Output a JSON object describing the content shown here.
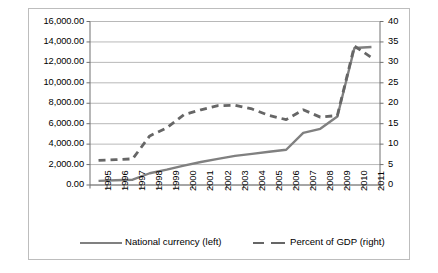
{
  "chart_data": {
    "type": "line",
    "title": "",
    "xlabel": "",
    "ylabel": "",
    "grid": true,
    "legend_position": "bottom",
    "x": [
      "1995",
      "1996",
      "1997",
      "1998",
      "1999",
      "2000",
      "2001",
      "2002",
      "2003",
      "2004",
      "2005",
      "2006",
      "2007",
      "2008",
      "2009",
      "2010",
      "2011"
    ],
    "categories": [
      "1995",
      "1996",
      "1997",
      "1998",
      "1999",
      "2000",
      "2001",
      "2002",
      "2003",
      "2004",
      "2005",
      "2006",
      "2007",
      "2008",
      "2009",
      "2010",
      "2011"
    ],
    "y_left": {
      "label": "",
      "ticks": [
        "0.00",
        "2,000.00",
        "4,000.00",
        "6,000.00",
        "8,000.00",
        "10,000.00",
        "12,000.00",
        "14,000.00",
        "16,000.00"
      ],
      "tick_values": [
        0,
        2000,
        4000,
        6000,
        8000,
        10000,
        12000,
        14000,
        16000
      ],
      "ylim": [
        0,
        16000
      ]
    },
    "y_right": {
      "label": "",
      "ticks": [
        "0",
        "5",
        "10",
        "15",
        "20",
        "25",
        "30",
        "35",
        "40"
      ],
      "tick_values": [
        0,
        5,
        10,
        15,
        20,
        25,
        30,
        35,
        40
      ],
      "ylim": [
        0,
        40
      ]
    },
    "series": [
      {
        "name": "National currency (left)",
        "axis": "left",
        "style": "solid",
        "color": "#808080",
        "values": [
          400,
          470,
          520,
          1150,
          1500,
          1900,
          2250,
          2550,
          2850,
          3050,
          3250,
          3450,
          5100,
          5500,
          6700,
          13400,
          13500
        ]
      },
      {
        "name": "Percent of GDP (right)",
        "axis": "right",
        "style": "dashed",
        "color": "#666666",
        "values": [
          6.0,
          6.2,
          6.4,
          12.0,
          14.0,
          17.2,
          18.4,
          19.4,
          19.5,
          18.6,
          17.0,
          16.0,
          18.4,
          16.6,
          17.0,
          34.0,
          31.2
        ]
      }
    ]
  },
  "legend": {
    "items": [
      {
        "label": "National currency (left)",
        "style": "solid",
        "color": "#808080"
      },
      {
        "label": "Percent of GDP (right)",
        "style": "dashed",
        "color": "#666666"
      }
    ]
  }
}
